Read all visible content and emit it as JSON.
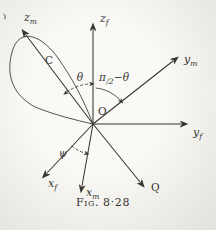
{
  "figure": {
    "caption_prefix": "Fig.",
    "caption_number": "8·28",
    "origin_label": "O",
    "curve_label": "C",
    "vector_q_label": "Q"
  },
  "axes": {
    "zf": {
      "main": "z",
      "sub": "f"
    },
    "zm": {
      "main": "z",
      "sub": "m"
    },
    "ym": {
      "main": "y",
      "sub": "m"
    },
    "yf": {
      "main": "y",
      "sub": "f"
    },
    "xf": {
      "main": "x",
      "sub": "f"
    },
    "xm": {
      "main": "x",
      "sub": "m"
    }
  },
  "angles": {
    "theta": "θ",
    "psi": "ψ",
    "pi_half_minus_theta": {
      "pi": "π",
      "den": "/2",
      "rest": "−θ"
    }
  },
  "colors": {
    "ink": "#37352f",
    "paper": "#f4f3ee"
  }
}
